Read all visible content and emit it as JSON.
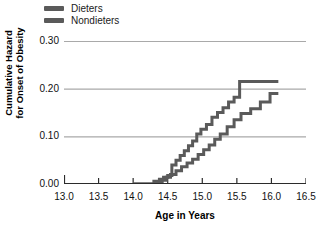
{
  "chart_data": {
    "type": "line",
    "subtype": "step-function (cumulative hazard / Nelson-Aalen)",
    "title": "",
    "xlabel": "Age in Years",
    "ylabel": "Cumulative Hazard\nfor Onset of Obesity",
    "ylabel_line1": "Cumulative Hazard",
    "ylabel_line2": "for Onset of Obesity",
    "xlim": [
      13.0,
      16.5
    ],
    "ylim": [
      0.0,
      0.3
    ],
    "xticks": [
      13.0,
      13.5,
      14.0,
      14.5,
      15.0,
      15.5,
      16.0,
      16.5
    ],
    "xtick_labels": [
      "13.0",
      "13.5",
      "14.0",
      "14.5",
      "15.0",
      "15.5",
      "16.0",
      "16.5"
    ],
    "yticks": [
      0.0,
      0.1,
      0.2,
      0.3
    ],
    "ytick_labels": [
      "0.00",
      "0.10",
      "0.20",
      "0.30"
    ],
    "grid": "horizontal",
    "legend_position": "top-left-outside",
    "line_color": "#5a5a5a",
    "grid_color": "#a9a9a9",
    "axis_color": "#2b2b2b",
    "series": [
      {
        "name": "Dieters",
        "color": "#5a5a5a",
        "x": [
          14.0,
          14.22,
          14.3,
          14.38,
          14.44,
          14.5,
          14.56,
          14.62,
          14.68,
          14.74,
          14.8,
          14.86,
          14.92,
          14.98,
          15.06,
          15.14,
          15.22,
          15.3,
          15.38,
          15.46,
          15.54,
          16.1
        ],
        "y": [
          0.0,
          0.0,
          0.006,
          0.01,
          0.014,
          0.018,
          0.04,
          0.05,
          0.06,
          0.07,
          0.08,
          0.09,
          0.105,
          0.115,
          0.125,
          0.14,
          0.15,
          0.16,
          0.172,
          0.182,
          0.215,
          0.215
        ]
      },
      {
        "name": "Nondieters",
        "color": "#5a5a5a",
        "x": [
          14.0,
          14.26,
          14.34,
          14.42,
          14.48,
          14.54,
          14.62,
          14.7,
          14.78,
          14.86,
          14.94,
          15.02,
          15.1,
          15.18,
          15.26,
          15.36,
          15.46,
          15.56,
          15.7,
          15.84,
          15.98,
          16.1
        ],
        "y": [
          0.0,
          0.0,
          0.004,
          0.008,
          0.014,
          0.02,
          0.028,
          0.036,
          0.044,
          0.052,
          0.062,
          0.072,
          0.082,
          0.094,
          0.105,
          0.12,
          0.135,
          0.148,
          0.158,
          0.172,
          0.19,
          0.19
        ]
      }
    ]
  },
  "legend": {
    "items": [
      {
        "label": "Dieters",
        "color": "#5a5a5a"
      },
      {
        "label": "Nondieters",
        "color": "#5a5a5a"
      }
    ]
  },
  "axes": {
    "x_title": "Age in Years",
    "y_title_line1": "Cumulative Hazard",
    "y_title_line2": "for Onset of Obesity",
    "x_tick_labels": [
      "13.0",
      "13.5",
      "14.0",
      "14.5",
      "15.0",
      "15.5",
      "16.0",
      "16.5"
    ],
    "y_tick_labels": [
      "0.30",
      "0.20",
      "0.10",
      "0.00"
    ]
  }
}
